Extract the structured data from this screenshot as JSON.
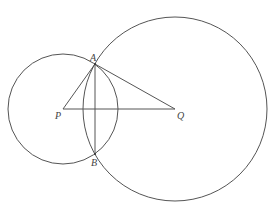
{
  "diagram": {
    "type": "geometry",
    "points": {
      "P": {
        "label": "P",
        "x": 63,
        "y": 109
      },
      "Q": {
        "label": "Q",
        "x": 175,
        "y": 109
      },
      "A": {
        "label": "A",
        "x": 95,
        "y": 64
      },
      "B": {
        "label": "B",
        "x": 95,
        "y": 154
      }
    },
    "circles": [
      {
        "name": "circle-P",
        "center": "P",
        "radius": 55
      },
      {
        "name": "circle-Q",
        "center": "Q",
        "radius": 92
      }
    ],
    "segments": [
      {
        "name": "segment-PA",
        "from": "P",
        "to": "A"
      },
      {
        "name": "segment-AQ",
        "from": "A",
        "to": "Q"
      },
      {
        "name": "segment-PQ",
        "from": "P",
        "to": "Q"
      },
      {
        "name": "segment-AB",
        "from": "A",
        "to": "B"
      }
    ],
    "labels": {
      "A": "A",
      "B": "B",
      "P": "P",
      "Q": "Q"
    },
    "colors": {
      "stroke": "#555555",
      "label": "#444444",
      "background": "#ffffff"
    }
  }
}
